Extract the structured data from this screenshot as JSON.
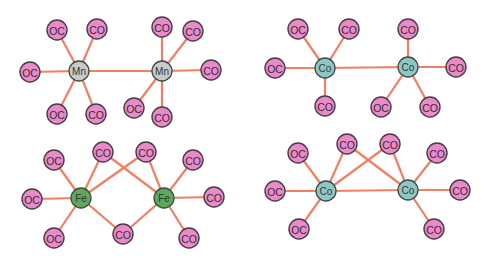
{
  "colors": {
    "bond": "#ef8063",
    "ligand_fill": "#e98bc9",
    "ligand_stroke": "#4b3a48",
    "Mn": "#c9c9c7",
    "Fe": "#5ea85a",
    "Co": "#8ec6c6"
  },
  "panels": [
    {
      "name": "Mn2(CO)10",
      "metal_label": "Mn",
      "metals": [
        {
          "id": "m1",
          "label": "Mn",
          "x": 79,
          "y": 71
        },
        {
          "id": "m2",
          "label": "Mn",
          "x": 162,
          "y": 71
        }
      ],
      "ligands": [
        {
          "id": "l1",
          "label": "OC",
          "x": 57,
          "y": 30
        },
        {
          "id": "l2",
          "label": "CO",
          "x": 97,
          "y": 29
        },
        {
          "id": "l3",
          "label": "OC",
          "x": 30,
          "y": 72
        },
        {
          "id": "l4",
          "label": "OC",
          "x": 57,
          "y": 114
        },
        {
          "id": "l5",
          "label": "CO",
          "x": 96,
          "y": 114
        },
        {
          "id": "l6",
          "label": "CO",
          "x": 162,
          "y": 27
        },
        {
          "id": "l7",
          "label": "CO",
          "x": 193,
          "y": 31
        },
        {
          "id": "l8",
          "label": "CO",
          "x": 211,
          "y": 70
        },
        {
          "id": "l9",
          "label": "OC",
          "x": 134,
          "y": 108
        },
        {
          "id": "l10",
          "label": "CO",
          "x": 162,
          "y": 117
        }
      ],
      "bonds": [
        [
          "m1",
          "m2"
        ],
        [
          "m1",
          "l1"
        ],
        [
          "m1",
          "l2"
        ],
        [
          "m1",
          "l3"
        ],
        [
          "m1",
          "l4"
        ],
        [
          "m1",
          "l5"
        ],
        [
          "m2",
          "l6"
        ],
        [
          "m2",
          "l7"
        ],
        [
          "m2",
          "l8"
        ],
        [
          "m2",
          "l9"
        ],
        [
          "m2",
          "l10"
        ]
      ]
    },
    {
      "name": "Co2(CO)8 non-bridged",
      "metal_label": "Co",
      "metals": [
        {
          "id": "m1",
          "label": "Co",
          "x": 325,
          "y": 68
        },
        {
          "id": "m2",
          "label": "Co",
          "x": 408,
          "y": 67
        }
      ],
      "ligands": [
        {
          "id": "l1",
          "label": "OC",
          "x": 298,
          "y": 29
        },
        {
          "id": "l2",
          "label": "CO",
          "x": 349,
          "y": 29
        },
        {
          "id": "l3",
          "label": "OC",
          "x": 275,
          "y": 68
        },
        {
          "id": "l4",
          "label": "CO",
          "x": 325,
          "y": 106
        },
        {
          "id": "l5",
          "label": "CO",
          "x": 408,
          "y": 29
        },
        {
          "id": "l6",
          "label": "CO",
          "x": 456,
          "y": 67
        },
        {
          "id": "l7",
          "label": "OC",
          "x": 381,
          "y": 107
        },
        {
          "id": "l8",
          "label": "CO",
          "x": 430,
          "y": 107
        }
      ],
      "bonds": [
        [
          "m1",
          "m2"
        ],
        [
          "m1",
          "l1"
        ],
        [
          "m1",
          "l2"
        ],
        [
          "m1",
          "l3"
        ],
        [
          "m1",
          "l4"
        ],
        [
          "m2",
          "l5"
        ],
        [
          "m2",
          "l6"
        ],
        [
          "m2",
          "l7"
        ],
        [
          "m2",
          "l8"
        ]
      ]
    },
    {
      "name": "Fe2(CO)9",
      "metal_label": "Fe",
      "metals": [
        {
          "id": "m1",
          "label": "Fe",
          "x": 81,
          "y": 198
        },
        {
          "id": "m2",
          "label": "Fe",
          "x": 164,
          "y": 198
        }
      ],
      "ligands": [
        {
          "id": "l1",
          "label": "OC",
          "x": 54,
          "y": 160
        },
        {
          "id": "l2",
          "label": "CO",
          "x": 103,
          "y": 152
        },
        {
          "id": "l3",
          "label": "CO",
          "x": 146,
          "y": 152
        },
        {
          "id": "l4",
          "label": "CO",
          "x": 193,
          "y": 160
        },
        {
          "id": "l5",
          "label": "OC",
          "x": 32,
          "y": 199
        },
        {
          "id": "l6",
          "label": "CO",
          "x": 214,
          "y": 197
        },
        {
          "id": "l7",
          "label": "OC",
          "x": 54,
          "y": 238
        },
        {
          "id": "l8",
          "label": "CO",
          "x": 123,
          "y": 234
        },
        {
          "id": "l9",
          "label": "CO",
          "x": 189,
          "y": 238
        }
      ],
      "bonds": [
        [
          "m1",
          "l1"
        ],
        [
          "m1",
          "l2"
        ],
        [
          "m1",
          "l3"
        ],
        [
          "m1",
          "l5"
        ],
        [
          "m1",
          "l7"
        ],
        [
          "m1",
          "l8"
        ],
        [
          "m2",
          "l2"
        ],
        [
          "m2",
          "l3"
        ],
        [
          "m2",
          "l4"
        ],
        [
          "m2",
          "l6"
        ],
        [
          "m2",
          "l8"
        ],
        [
          "m2",
          "l9"
        ]
      ]
    },
    {
      "name": "Co2(CO)8 bridged",
      "metal_label": "Co",
      "metals": [
        {
          "id": "m1",
          "label": "Co",
          "x": 326,
          "y": 191
        },
        {
          "id": "m2",
          "label": "Co",
          "x": 408,
          "y": 190
        }
      ],
      "ligands": [
        {
          "id": "l1",
          "label": "OC",
          "x": 298,
          "y": 153
        },
        {
          "id": "l2",
          "label": "CO",
          "x": 347,
          "y": 144
        },
        {
          "id": "l3",
          "label": "CO",
          "x": 390,
          "y": 144
        },
        {
          "id": "l4",
          "label": "CO",
          "x": 437,
          "y": 153
        },
        {
          "id": "l5",
          "label": "OC",
          "x": 275,
          "y": 191
        },
        {
          "id": "l6",
          "label": "CO",
          "x": 460,
          "y": 190
        },
        {
          "id": "l7",
          "label": "OC",
          "x": 299,
          "y": 229
        },
        {
          "id": "l8",
          "label": "CO",
          "x": 434,
          "y": 229
        }
      ],
      "bonds": [
        [
          "m1",
          "m2"
        ],
        [
          "m1",
          "l1"
        ],
        [
          "m1",
          "l2"
        ],
        [
          "m1",
          "l3"
        ],
        [
          "m1",
          "l5"
        ],
        [
          "m1",
          "l7"
        ],
        [
          "m2",
          "l2"
        ],
        [
          "m2",
          "l3"
        ],
        [
          "m2",
          "l4"
        ],
        [
          "m2",
          "l6"
        ],
        [
          "m2",
          "l8"
        ]
      ]
    }
  ]
}
